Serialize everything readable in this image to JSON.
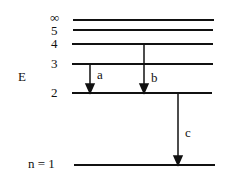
{
  "diagram": {
    "axis_label": "E",
    "levels": [
      {
        "label": "∞",
        "y": 20
      },
      {
        "label": "5",
        "y": 30
      },
      {
        "label": "4",
        "y": 44
      },
      {
        "label": "3",
        "y": 64
      },
      {
        "label": "2",
        "y": 93
      },
      {
        "label": "n = 1",
        "y": 165
      }
    ],
    "transitions": [
      {
        "label": "a",
        "from": "3",
        "to": "2"
      },
      {
        "label": "b",
        "from": "4",
        "to": "2"
      },
      {
        "label": "c",
        "from": "2",
        "to": "1"
      }
    ]
  }
}
